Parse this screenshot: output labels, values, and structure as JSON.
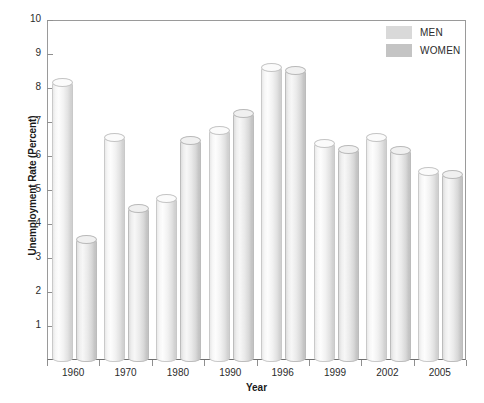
{
  "chart_data": {
    "type": "bar",
    "title": "",
    "xlabel": "Year",
    "ylabel": "Unemployment Rate (Percent)",
    "categories": [
      "1960",
      "1970",
      "1980",
      "1990",
      "1996",
      "1999",
      "2002",
      "2005"
    ],
    "series": [
      {
        "name": "MEN",
        "color": "#d9d9d9",
        "values": [
          8.2,
          6.6,
          4.8,
          6.8,
          8.65,
          6.4,
          6.6,
          5.6
        ]
      },
      {
        "name": "WOMEN",
        "color": "#c4c4c4",
        "values": [
          3.6,
          4.5,
          6.5,
          7.3,
          8.55,
          6.25,
          6.2,
          5.5
        ]
      }
    ],
    "ylim": [
      0,
      10
    ],
    "yticks": [
      1,
      2,
      3,
      4,
      5,
      6,
      7,
      8,
      9,
      10
    ],
    "ytick_labels": [
      "1",
      "2",
      "3",
      "4",
      "5",
      "6",
      "7",
      "8",
      "9",
      "10"
    ],
    "grid": false,
    "legend_position": "top-right",
    "legend": [
      "MEN",
      "WOMEN"
    ]
  }
}
